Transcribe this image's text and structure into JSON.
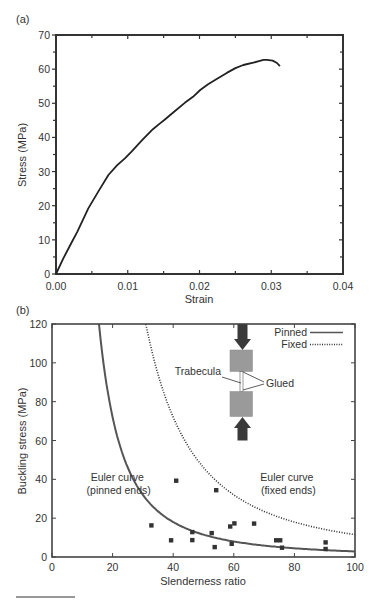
{
  "chart_data": [
    {
      "panel_label": "(a)",
      "type": "line",
      "title": "",
      "xlabel": "Strain",
      "ylabel": "Stress (MPa)",
      "xlim": [
        0,
        0.04
      ],
      "ylim": [
        0,
        70
      ],
      "xticks": [
        0.0,
        0.01,
        0.02,
        0.03,
        0.04
      ],
      "xtick_labels": [
        "0.00",
        "0.01",
        "0.02",
        "0.03",
        "0.04"
      ],
      "yticks": [
        0,
        10,
        20,
        30,
        40,
        50,
        60,
        70
      ],
      "ytick_labels": [
        "0",
        "10",
        "20",
        "30",
        "40",
        "50",
        "60",
        "70"
      ],
      "grid": false,
      "series": [
        {
          "name": "stress-strain",
          "color": "#222222",
          "x": [
            0.0,
            0.001,
            0.002,
            0.003,
            0.0045,
            0.006,
            0.0073,
            0.0085,
            0.0096,
            0.0105,
            0.012,
            0.0135,
            0.0145,
            0.0151,
            0.0165,
            0.018,
            0.0191,
            0.0201,
            0.0212,
            0.0224,
            0.0238,
            0.025,
            0.0261,
            0.0275,
            0.0284,
            0.0289,
            0.0294,
            0.0302,
            0.0308,
            0.0312
          ],
          "y": [
            0.0,
            4.5,
            8.5,
            12.5,
            19.2,
            24.5,
            29.0,
            31.8,
            33.9,
            35.8,
            39.2,
            42.4,
            44.1,
            45.1,
            47.6,
            50.2,
            51.9,
            53.9,
            55.6,
            57.1,
            58.9,
            60.3,
            61.2,
            61.9,
            62.4,
            62.7,
            62.7,
            62.5,
            61.8,
            60.9
          ]
        }
      ]
    },
    {
      "panel_label": "(b)",
      "type": "scatter",
      "title": "",
      "xlabel": "Slenderness ratio",
      "ylabel": "Buckling stress (MPa)",
      "xlim": [
        0,
        100
      ],
      "ylim": [
        0,
        120
      ],
      "xticks": [
        0,
        20,
        40,
        60,
        80,
        100
      ],
      "xtick_labels": [
        "0",
        "20",
        "40",
        "60",
        "80",
        "100"
      ],
      "yticks": [
        0,
        20,
        40,
        60,
        80,
        100,
        120
      ],
      "ytick_labels": [
        "0",
        "20",
        "40",
        "60",
        "80",
        "100",
        "120"
      ],
      "grid": false,
      "legend": {
        "placement": "top-right",
        "entries": [
          {
            "label": "Pinned",
            "style": "solid"
          },
          {
            "label": "Fixed",
            "style": "dotted"
          }
        ]
      },
      "curves": [
        {
          "name": "Pinned",
          "style": "solid",
          "color": "#555555",
          "formula": "sigma = k / lambda^2",
          "k": 28800,
          "description": "Euler curve (pinned ends)"
        },
        {
          "name": "Fixed",
          "style": "dotted",
          "color": "#333333",
          "formula": "sigma = k / lambda^2",
          "k": 115200,
          "description": "Euler curve (fixed ends)"
        }
      ],
      "points": {
        "name": "measured",
        "color": "#333333",
        "x": [
          32.8,
          39.3,
          41.0,
          46.3,
          46.3,
          52.7,
          53.7,
          54.2,
          58.8,
          59.3,
          60.2,
          66.7,
          74.0,
          75.3,
          75.9,
          90.3,
          90.3
        ],
        "y": [
          16.3,
          8.6,
          39.3,
          12.8,
          8.7,
          12.3,
          5.1,
          34.4,
          15.7,
          6.8,
          17.3,
          17.2,
          8.6,
          8.6,
          4.8,
          7.5,
          4.1
        ]
      },
      "annotations": [
        {
          "lines": [
            "Euler curve",
            "(pinned ends)"
          ],
          "at": [
            22,
            38
          ]
        },
        {
          "lines": [
            "Euler curve",
            "(fixed ends)"
          ],
          "at": [
            78,
            38
          ]
        }
      ],
      "inset": {
        "labels": {
          "specimen": "Trabecula",
          "joint": "Glued"
        },
        "block_color": "#9a9a9a",
        "arrow_color": "#3a3a3a"
      }
    }
  ]
}
